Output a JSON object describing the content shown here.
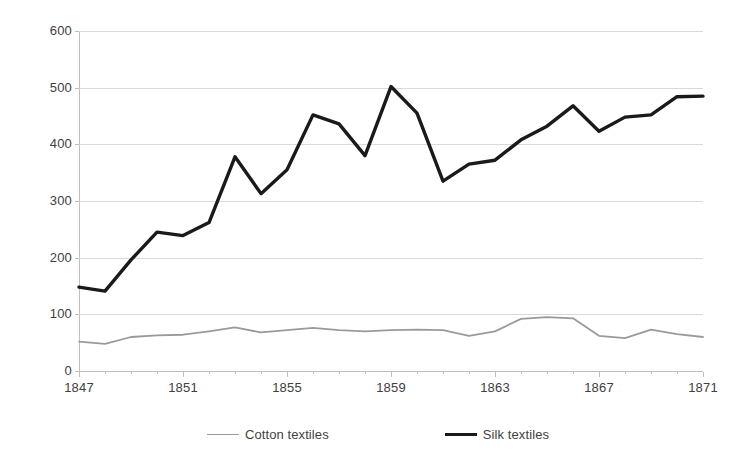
{
  "chart_data": {
    "type": "line",
    "title": "",
    "subtitle": "",
    "xlabel": "",
    "ylabel": "",
    "xlim": [
      1847,
      1871
    ],
    "ylim": [
      0,
      600
    ],
    "grid": true,
    "legend_position": "bottom",
    "x": [
      1847,
      1848,
      1849,
      1850,
      1851,
      1852,
      1853,
      1854,
      1855,
      1856,
      1857,
      1858,
      1859,
      1860,
      1861,
      1862,
      1863,
      1864,
      1865,
      1866,
      1867,
      1868,
      1869,
      1870,
      1871
    ],
    "y_ticks": [
      0,
      100,
      200,
      300,
      400,
      500,
      600
    ],
    "y_tick_labels": [
      "0",
      "100",
      "200",
      "300",
      "400",
      "500",
      "600"
    ],
    "x_ticks": [
      1847,
      1851,
      1855,
      1859,
      1863,
      1867,
      1871
    ],
    "x_tick_labels": [
      "1847",
      "1851",
      "1855",
      "1859",
      "1863",
      "1867",
      "1871"
    ],
    "series": [
      {
        "name": "Cotton textiles",
        "color": "#9a9a9a",
        "width": 1.8,
        "values": [
          52,
          48,
          60,
          63,
          64,
          70,
          77,
          68,
          72,
          76,
          72,
          70,
          72,
          73,
          72,
          62,
          70,
          92,
          95,
          93,
          62,
          58,
          73,
          65,
          60
        ]
      },
      {
        "name": "Silk textiles",
        "color": "#1a1a1a",
        "width": 3.4,
        "values": [
          148,
          141,
          196,
          245,
          239,
          262,
          378,
          313,
          355,
          452,
          436,
          380,
          502,
          455,
          335,
          365,
          372,
          408,
          432,
          468,
          423,
          448,
          452,
          484,
          485
        ]
      }
    ]
  },
  "legend": {
    "items": [
      {
        "label": "Cotton textiles"
      },
      {
        "label": "Silk textiles"
      }
    ]
  },
  "colors": {
    "cotton": "#9a9a9a",
    "silk": "#1a1a1a",
    "gridline": "#d9d9d9",
    "axis": "#bfbfbf",
    "text": "#404040",
    "background": "#ffffff"
  }
}
